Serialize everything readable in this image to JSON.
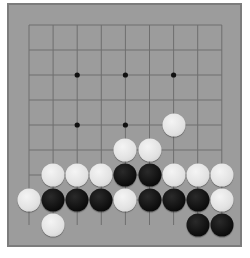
{
  "board": {
    "size": 9,
    "colors": {
      "board_fill": "#9c9c9c",
      "board_border": "#7c7c7c",
      "grid_line": "#6e6e6e",
      "black_stone": "#0c0c0c",
      "white_stone": "#e2e2e2"
    },
    "geometry": {
      "x0": 29,
      "y0": 25,
      "dx": 24.1,
      "dy": 25
    },
    "star_points": [
      {
        "col": 3,
        "row": 3
      },
      {
        "col": 5,
        "row": 3
      },
      {
        "col": 7,
        "row": 3
      },
      {
        "col": 3,
        "row": 5
      },
      {
        "col": 5,
        "row": 5
      }
    ],
    "stones": [
      {
        "col": 7,
        "row": 5,
        "color": "white"
      },
      {
        "col": 5,
        "row": 6,
        "color": "white"
      },
      {
        "col": 6,
        "row": 6,
        "color": "white"
      },
      {
        "col": 2,
        "row": 7,
        "color": "white"
      },
      {
        "col": 3,
        "row": 7,
        "color": "white"
      },
      {
        "col": 4,
        "row": 7,
        "color": "white"
      },
      {
        "col": 5,
        "row": 7,
        "color": "black"
      },
      {
        "col": 6,
        "row": 7,
        "color": "black"
      },
      {
        "col": 7,
        "row": 7,
        "color": "white"
      },
      {
        "col": 8,
        "row": 7,
        "color": "white"
      },
      {
        "col": 9,
        "row": 7,
        "color": "white"
      },
      {
        "col": 1,
        "row": 8,
        "color": "white"
      },
      {
        "col": 2,
        "row": 8,
        "color": "black"
      },
      {
        "col": 3,
        "row": 8,
        "color": "black"
      },
      {
        "col": 4,
        "row": 8,
        "color": "black"
      },
      {
        "col": 5,
        "row": 8,
        "color": "white"
      },
      {
        "col": 6,
        "row": 8,
        "color": "black"
      },
      {
        "col": 7,
        "row": 8,
        "color": "black"
      },
      {
        "col": 8,
        "row": 8,
        "color": "black"
      },
      {
        "col": 9,
        "row": 8,
        "color": "white"
      },
      {
        "col": 2,
        "row": 9,
        "color": "white"
      },
      {
        "col": 8,
        "row": 9,
        "color": "black"
      },
      {
        "col": 9,
        "row": 9,
        "color": "black"
      }
    ]
  }
}
